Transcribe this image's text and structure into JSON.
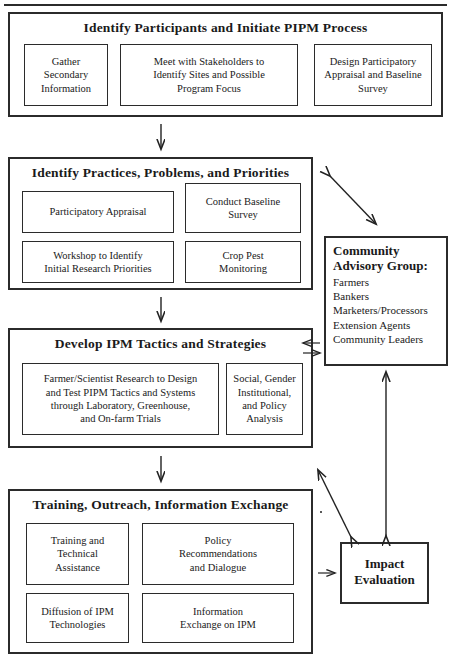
{
  "diagram": {
    "stages": [
      {
        "id": "stage-1",
        "title": "Identify Participants and Initiate PIPM Process",
        "boxes": [
          {
            "id": "gather-secondary-information",
            "lines": [
              "Gather",
              "Secondary",
              "Information"
            ]
          },
          {
            "id": "meet-with-stakeholders",
            "lines": [
              "Meet with Stakeholders to",
              "Identify Sites and Possible",
              "Program Focus"
            ]
          },
          {
            "id": "design-participatory-appraisal",
            "lines": [
              "Design Participatory",
              "Appraisal and Baseline",
              "Survey"
            ]
          }
        ]
      },
      {
        "id": "stage-2",
        "title": "Identify Practices, Problems, and Priorities",
        "boxes": [
          {
            "id": "participatory-appraisal",
            "lines": [
              "Participatory Appraisal"
            ]
          },
          {
            "id": "conduct-baseline-survey",
            "lines": [
              "Conduct Baseline",
              "Survey"
            ]
          },
          {
            "id": "workshop-to-identify-priorities",
            "lines": [
              "Workshop to Identify",
              "Initial Research Priorities"
            ]
          },
          {
            "id": "crop-pest-monitoring",
            "lines": [
              "Crop Pest",
              "Monitoring"
            ]
          }
        ]
      },
      {
        "id": "stage-3",
        "title": "Develop IPM Tactics and Strategies",
        "boxes": [
          {
            "id": "farmer-scientist-research",
            "lines": [
              "Farmer/Scientist Research to Design",
              "and Test PIPM Tactics and Systems",
              "through Laboratory, Greenhouse,",
              "and On-farm Trials"
            ]
          },
          {
            "id": "social-gender-policy-analysis",
            "lines": [
              "Social, Gender",
              "Institutional,",
              "and Policy",
              "Analysis"
            ]
          }
        ]
      },
      {
        "id": "stage-4",
        "title": "Training, Outreach, Information Exchange",
        "boxes": [
          {
            "id": "training-technical-assistance",
            "lines": [
              "Training and",
              "Technical",
              "Assistance"
            ]
          },
          {
            "id": "policy-recommendations",
            "lines": [
              "Policy",
              "Recommendations",
              "and Dialogue"
            ]
          },
          {
            "id": "diffusion-of-ipm-technologies",
            "lines": [
              "Diffusion of IPM",
              "Technologies"
            ]
          },
          {
            "id": "information-exchange-on-ipm",
            "lines": [
              "Information",
              "Exchange on IPM"
            ]
          }
        ]
      }
    ],
    "side": {
      "community_advisory_group": {
        "title_lines": [
          "Community",
          "Advisory Group:"
        ],
        "members": [
          "Farmers",
          "Bankers",
          "Marketers/Processors",
          "Extension Agents",
          "Community Leaders"
        ]
      },
      "impact_evaluation": {
        "lines": [
          "Impact",
          "Evaluation"
        ]
      }
    },
    "connectors": [
      {
        "id": "stage1-to-stage2",
        "type": "arrow-down"
      },
      {
        "id": "stage2-to-stage3",
        "type": "arrow-down"
      },
      {
        "id": "stage3-to-stage4",
        "type": "arrow-down"
      },
      {
        "id": "stage2-to-cag",
        "type": "arrow-double-diagonal"
      },
      {
        "id": "stage3-to-cag",
        "type": "arrow-double-horizontal"
      },
      {
        "id": "stage4-to-cag",
        "type": "arrow-double-diagonal"
      },
      {
        "id": "cag-to-impact",
        "type": "arrow-double-vertical"
      },
      {
        "id": "stage4-to-impact",
        "type": "arrow-right"
      }
    ],
    "colors": {
      "line": "#2b2b2b",
      "text": "#1a1a1a",
      "background": "#ffffff"
    }
  }
}
